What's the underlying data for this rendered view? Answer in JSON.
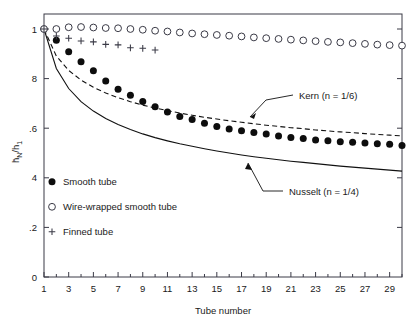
{
  "chart_data": {
    "type": "scatter",
    "title": "",
    "xlabel": "Tube number",
    "ylabel": "h̄N/h1",
    "ylabel_parts": {
      "main": "h",
      "sub1": "N",
      "denom": "h",
      "sub2": "1",
      "overbar": true
    },
    "xlim": [
      1,
      30
    ],
    "ylim": [
      0,
      1
    ],
    "grid": false,
    "legend_position": "lower-left-inside",
    "xticks": [
      1,
      3,
      5,
      7,
      9,
      11,
      13,
      15,
      17,
      19,
      21,
      23,
      25,
      27,
      29
    ],
    "xticklabels": [
      "1",
      "3",
      "5",
      "7",
      "9",
      "11",
      "13",
      "15",
      "17",
      "19",
      "21",
      "23",
      "25",
      "27",
      "29"
    ],
    "xminorticks": [
      2,
      4,
      6,
      8,
      10,
      12,
      14,
      16,
      18,
      20,
      22,
      24,
      26,
      28,
      30
    ],
    "yticks": [
      0,
      0.2,
      0.4,
      0.6,
      0.8,
      1
    ],
    "yticklabels": [
      "0",
      ".2",
      "4",
      ".6",
      "8",
      "1"
    ],
    "series": [
      {
        "name": "Smooth tube",
        "marker": "filled-circle",
        "x": [
          1,
          2,
          3,
          4,
          5,
          6,
          7,
          8,
          9,
          10,
          11,
          12,
          13,
          14,
          15,
          16,
          17,
          18,
          19,
          20,
          21,
          22,
          23,
          24,
          25,
          26,
          27,
          28,
          29,
          30
        ],
        "values": [
          1.0,
          0.955,
          0.908,
          0.868,
          0.832,
          0.79,
          0.757,
          0.733,
          0.708,
          0.686,
          0.665,
          0.647,
          0.635,
          0.62,
          0.607,
          0.597,
          0.59,
          0.583,
          0.577,
          0.569,
          0.563,
          0.558,
          0.552,
          0.549,
          0.545,
          0.543,
          0.54,
          0.537,
          0.535,
          0.53
        ]
      },
      {
        "name": "Wire-wrapped smooth tube",
        "marker": "open-circle",
        "x": [
          1,
          2,
          3,
          4,
          5,
          6,
          7,
          8,
          9,
          10,
          11,
          12,
          13,
          14,
          15,
          16,
          17,
          18,
          19,
          20,
          21,
          22,
          23,
          24,
          25,
          26,
          27,
          28,
          29,
          30
        ],
        "values": [
          1.0,
          1.0,
          1.007,
          1.008,
          1.006,
          1.004,
          1.003,
          1.0,
          0.997,
          0.993,
          0.99,
          0.986,
          0.982,
          0.979,
          0.976,
          0.973,
          0.97,
          0.966,
          0.963,
          0.96,
          0.957,
          0.954,
          0.951,
          0.948,
          0.946,
          0.943,
          0.94,
          0.937,
          0.935,
          0.933
        ]
      },
      {
        "name": "Finned tube",
        "marker": "plus",
        "x": [
          1,
          2,
          3,
          4,
          5,
          6,
          7,
          8,
          9,
          10
        ],
        "values": [
          1.0,
          0.972,
          0.963,
          0.952,
          0.948,
          0.938,
          0.936,
          0.924,
          0.922,
          0.915
        ]
      }
    ],
    "curves": [
      {
        "name": "Kern (n = 1/6)",
        "style": "dashed",
        "formula_exponent": 0.1667,
        "x": [
          1,
          2,
          3,
          4,
          5,
          6,
          7,
          8,
          9,
          10,
          11,
          12,
          13,
          14,
          15,
          16,
          17,
          18,
          19,
          20,
          21,
          22,
          23,
          24,
          25,
          26,
          27,
          28,
          29,
          30
        ],
        "values": [
          1.0,
          0.891,
          0.833,
          0.794,
          0.765,
          0.742,
          0.723,
          0.707,
          0.693,
          0.681,
          0.671,
          0.661,
          0.652,
          0.644,
          0.637,
          0.63,
          0.624,
          0.618,
          0.612,
          0.607,
          0.602,
          0.598,
          0.593,
          0.589,
          0.585,
          0.582,
          0.578,
          0.575,
          0.572,
          0.569
        ]
      },
      {
        "name": "Nusselt (n = 1/4)",
        "style": "solid",
        "formula_exponent": 0.25,
        "x": [
          1,
          2,
          3,
          4,
          5,
          6,
          7,
          8,
          9,
          10,
          11,
          12,
          13,
          14,
          15,
          16,
          17,
          18,
          19,
          20,
          21,
          22,
          23,
          24,
          25,
          26,
          27,
          28,
          29,
          30
        ],
        "values": [
          1.0,
          0.841,
          0.76,
          0.707,
          0.669,
          0.639,
          0.615,
          0.595,
          0.577,
          0.562,
          0.549,
          0.537,
          0.527,
          0.517,
          0.508,
          0.5,
          0.492,
          0.485,
          0.479,
          0.473,
          0.467,
          0.462,
          0.457,
          0.452,
          0.447,
          0.443,
          0.439,
          0.435,
          0.431,
          0.427
        ]
      }
    ],
    "annotations": [
      {
        "text": "Kern (n = 1/6)",
        "target_x": 20,
        "target_y": 0.6
      },
      {
        "text": "Nusselt (n = 1/4)",
        "target_x": 19.5,
        "target_y": 0.478
      }
    ],
    "legend": [
      {
        "label": "Smooth tube",
        "marker": "filled-circle"
      },
      {
        "label": "Wire-wrapped smooth tube",
        "marker": "open-circle"
      },
      {
        "label": "Finned tube",
        "marker": "plus"
      }
    ],
    "colors": {
      "ink": "#1a1a1a",
      "axis": "#3a3a46",
      "marker_filled": "#0d0d0d",
      "marker_open_edge": "#3a3a46",
      "background": "#ffffff"
    }
  }
}
